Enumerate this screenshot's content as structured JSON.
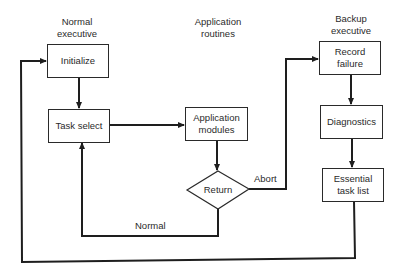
{
  "diagram": {
    "type": "flowchart",
    "columns": {
      "normal": "Normal\nexecutive",
      "application": "Application\nroutines",
      "backup": "Backup\nexecutive"
    },
    "nodes": {
      "initialize": "Initialize",
      "task_select": "Task select",
      "application_modules": "Application\nmodules",
      "return": "Return",
      "record_failure": "Record\nfailure",
      "diagnostics": "Diagnostics",
      "essential_task_list": "Essential\ntask list"
    },
    "edge_labels": {
      "abort": "Abort",
      "normal": "Normal"
    },
    "edges": [
      {
        "from": "initialize",
        "to": "task_select"
      },
      {
        "from": "task_select",
        "to": "application_modules"
      },
      {
        "from": "application_modules",
        "to": "return"
      },
      {
        "from": "return",
        "to": "task_select",
        "label": "Normal"
      },
      {
        "from": "return",
        "to": "record_failure",
        "label": "Abort"
      },
      {
        "from": "record_failure",
        "to": "diagnostics"
      },
      {
        "from": "diagnostics",
        "to": "essential_task_list"
      },
      {
        "from": "essential_task_list",
        "to": "initialize"
      }
    ]
  }
}
